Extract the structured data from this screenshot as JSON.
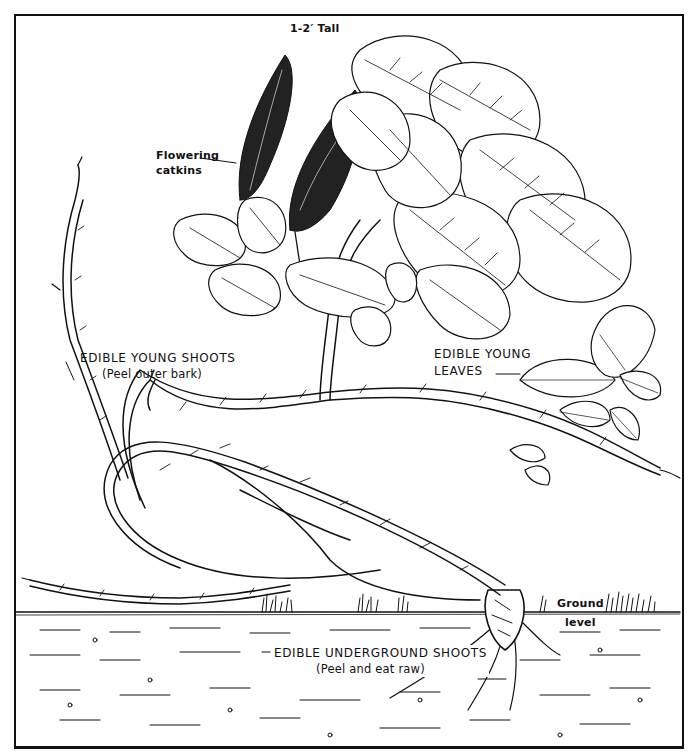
{
  "illustration": {
    "subject": "willow-like shrub with catkins",
    "labels": {
      "height": "1-2′ Tall",
      "flowers": {
        "line1": "Flowering",
        "line2": "catkins"
      },
      "shoots": {
        "line1": "EDIBLE YOUNG SHOOTS",
        "line2": "(Peel outer bark)"
      },
      "leaves": {
        "line1": "EDIBLE YOUNG",
        "line2": "LEAVES"
      },
      "ground": {
        "line1": "Ground",
        "line2": "level"
      },
      "underground": {
        "line1": "EDIBLE UNDERGROUND SHOOTS",
        "line2": "(Peel and eat raw)"
      }
    },
    "colors": {
      "ink": "#111111",
      "paper": "#ffffff"
    }
  }
}
